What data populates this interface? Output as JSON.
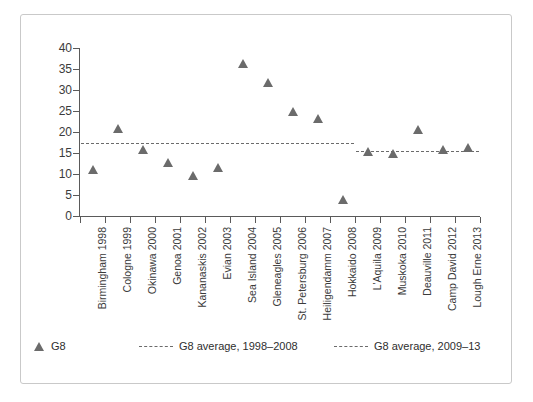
{
  "chart_data": {
    "type": "scatter",
    "title": "",
    "subtitle": "",
    "xlabel": "",
    "ylabel": "",
    "ylim": [
      0,
      40
    ],
    "ytick_labels": [
      "40",
      "35",
      "30",
      "25",
      "20",
      "15",
      "10",
      "5",
      "0"
    ],
    "ytick_values": [
      40,
      35,
      30,
      25,
      20,
      15,
      10,
      5,
      0
    ],
    "grid": false,
    "legend_position": "bottom",
    "categories": [
      "Birmingham 1998",
      "Cologne 1999",
      "Okinawa 2000",
      "Genoa 2001",
      "Kananaskis 2002",
      "Evian 2003",
      "Sea Island 2004",
      "Gleneagles 2005",
      "St. Petersburg 2006",
      "Heiligendamm 2007",
      "Hokkaido 2008",
      "L'Aquila 2009",
      "Muskoka 2010",
      "Deauville 2011",
      "Camp David 2012",
      "Lough Erne 2013"
    ],
    "series": [
      {
        "name": "G8",
        "marker": "triangle",
        "color": "#6b6b6b",
        "values": [
          10.2,
          20.0,
          15.0,
          12.0,
          8.7,
          10.8,
          35.5,
          31.0,
          24.0,
          22.3,
          3.0,
          14.6,
          14.0,
          19.7,
          15.0,
          15.5
        ]
      }
    ],
    "reference_lines": [
      {
        "name": "G8 average, 1998–2008",
        "value": 17.5,
        "style": "dashed",
        "color": "#6b6b6b",
        "span_categories": [
          "Birmingham 1998",
          "Hokkaido 2008"
        ]
      },
      {
        "name": "G8 average, 2009–13",
        "value": 15.5,
        "style": "dashed",
        "color": "#6b6b6b",
        "span_categories": [
          "L'Aquila 2009",
          "Lough Erne 2013"
        ]
      }
    ]
  },
  "legend": {
    "entries": [
      {
        "label": "G8",
        "glyph": "triangle-marker"
      },
      {
        "label": "G8 average, 1998–2008",
        "glyph": "dashed-line"
      },
      {
        "label": "G8 average, 2009–13",
        "glyph": "dashed-line"
      }
    ]
  }
}
